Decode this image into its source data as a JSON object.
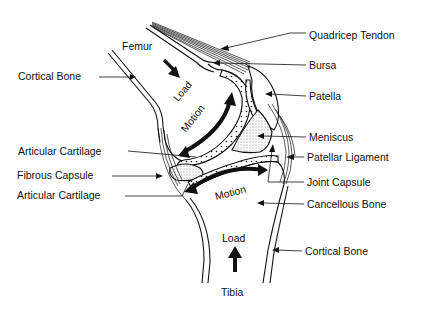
{
  "labels": {
    "femur": "Femur",
    "tibia": "Tibia",
    "load_top": "Load",
    "load_bottom": "Load",
    "motion_top": "Motion",
    "motion_bottom": "Motion",
    "cortical_bone_top": "Cortical Bone",
    "articular_cartilage_top": "Articular Cartilage",
    "fibrous_capsule": "Fibrous Capsule",
    "articular_cartilage_bottom": "Articular Cartilage",
    "quadricep_tendon": "Quadricep Tendon",
    "bursa": "Bursa",
    "patella": "Patella",
    "meniscus": "Meniscus",
    "patellar_ligament": "Patellar Ligament",
    "joint_capsule": "Joint Capsule",
    "cancellous_bone": "Cancellous Bone",
    "cortical_bone_bottom": "Cortical Bone"
  },
  "colors": {
    "ink": "#111111",
    "background": "#ffffff"
  }
}
